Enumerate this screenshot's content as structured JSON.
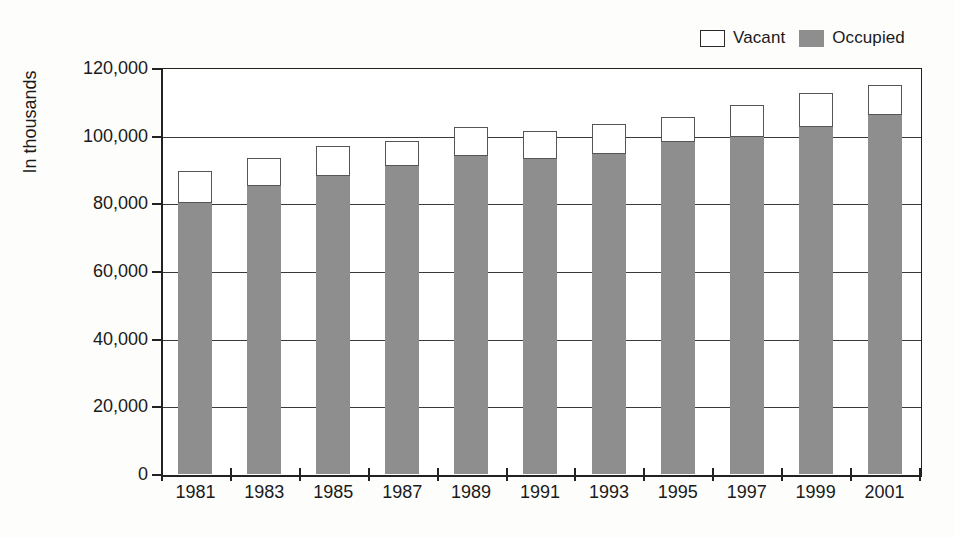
{
  "chart_data": {
    "type": "bar",
    "title": "",
    "subtitle": "",
    "xlabel": "",
    "ylabel": "In thousands",
    "stacked": true,
    "grid": true,
    "legend_position": "top-right",
    "categories": [
      "1981",
      "1983",
      "1985",
      "1987",
      "1989",
      "1991",
      "1993",
      "1995",
      "1997",
      "1999",
      "2001"
    ],
    "ylim": [
      0,
      120000
    ],
    "yticks": [
      0,
      20000,
      40000,
      60000,
      80000,
      100000,
      120000
    ],
    "ytick_labels": [
      "0",
      "20,000",
      "40,000",
      "60,000",
      "80,000",
      "100,000",
      "120,000"
    ],
    "series": [
      {
        "name": "Occupied",
        "color": "#8e8e8e",
        "values": [
          80000,
          85000,
          88000,
          91000,
          94000,
          93000,
          94500,
          98000,
          99500,
          102500,
          106000
        ]
      },
      {
        "name": "Vacant",
        "color": "#ffffff",
        "values": [
          9500,
          8500,
          9000,
          7500,
          8500,
          8500,
          9000,
          7500,
          9500,
          10000,
          9000
        ]
      }
    ],
    "totals": [
      89500,
      93500,
      97000,
      98500,
      102500,
      101500,
      103500,
      105500,
      109000,
      112500,
      115000
    ]
  },
  "legend": {
    "entries": [
      {
        "label": "Vacant",
        "swatch": "vacant-swatch"
      },
      {
        "label": "Occupied",
        "swatch": "occupied-swatch"
      }
    ]
  },
  "axis": {
    "y_title": "In thousands"
  }
}
